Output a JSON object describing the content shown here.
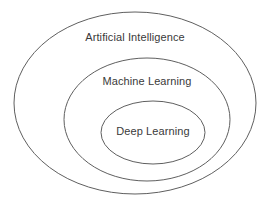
{
  "diagram": {
    "type": "nested-venn",
    "canvas": {
      "width": 270,
      "height": 206,
      "background": "#ffffff"
    },
    "stroke_color": "#5f5f5f",
    "text_color": "#3a3a3a",
    "levels": [
      {
        "id": "artificial-intelligence",
        "label": "Artificial Intelligence",
        "ellipse": {
          "cx": 135,
          "cy": 103,
          "rx": 121,
          "ry": 91
        },
        "label_pos": {
          "x": 135,
          "y": 37
        }
      },
      {
        "id": "machine-learning",
        "label": "Machine Learning",
        "ellipse": {
          "cx": 147,
          "cy": 119.5,
          "rx": 83,
          "ry": 61.5
        },
        "label_pos": {
          "x": 147,
          "y": 81
        }
      },
      {
        "id": "deep-learning",
        "label": "Deep Learning",
        "ellipse": {
          "cx": 153,
          "cy": 132.5,
          "rx": 52,
          "ry": 31.5
        },
        "label_pos": {
          "x": 153,
          "y": 131
        }
      }
    ]
  }
}
